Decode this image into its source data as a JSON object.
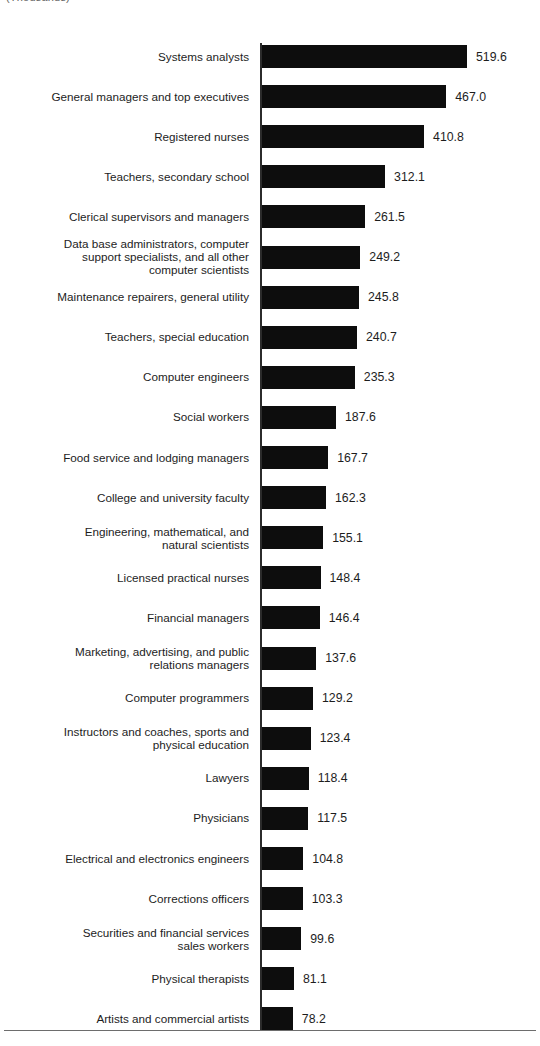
{
  "header": {
    "note": "(Thousands)"
  },
  "chart_data": {
    "type": "bar",
    "orientation": "horizontal",
    "title": "",
    "subtitle": "",
    "xlabel": "",
    "ylabel": "",
    "units": "Thousands",
    "grid": false,
    "legend": null,
    "axis_baseline": 0,
    "xlim": [
      0,
      519.6
    ],
    "categories": [
      "Systems analysts",
      "General managers and top executives",
      "Registered nurses",
      "Teachers, secondary school",
      "Clerical supervisors and managers",
      "Data base administrators, computer\nsupport specialists, and all other\ncomputer scientists",
      "Maintenance repairers, general utility",
      "Teachers, special education",
      "Computer engineers",
      "Social workers",
      "Food service and lodging managers",
      "College and university faculty",
      "Engineering, mathematical, and\nnatural scientists",
      "Licensed practical nurses",
      "Financial managers",
      "Marketing, advertising, and public\nrelations managers",
      "Computer programmers",
      "Instructors and coaches, sports and\nphysical education",
      "Lawyers",
      "Physicians",
      "Electrical and electronics engineers",
      "Corrections officers",
      "Securities and financial services\nsales workers",
      "Physical therapists",
      "Artists and commercial artists"
    ],
    "values": [
      519.6,
      467.0,
      410.8,
      312.1,
      261.5,
      249.2,
      245.8,
      240.7,
      235.3,
      187.6,
      167.7,
      162.3,
      155.1,
      148.4,
      146.4,
      137.6,
      129.2,
      123.4,
      118.4,
      117.5,
      104.8,
      103.3,
      99.6,
      81.1,
      78.2
    ],
    "value_labels": [
      "519.6",
      "467.0",
      "410.8",
      "312.1",
      "261.5",
      "249.2",
      "245.8",
      "240.7",
      "235.3",
      "187.6",
      "167.7",
      "162.3",
      "155.1",
      "148.4",
      "146.4",
      "137.6",
      "129.2",
      "123.4",
      "118.4",
      "117.5",
      "104.8",
      "103.3",
      "99.6",
      "81.1",
      "78.2"
    ],
    "bar_color": "#0d0d0d",
    "axis_color": "#2b2b2b"
  }
}
